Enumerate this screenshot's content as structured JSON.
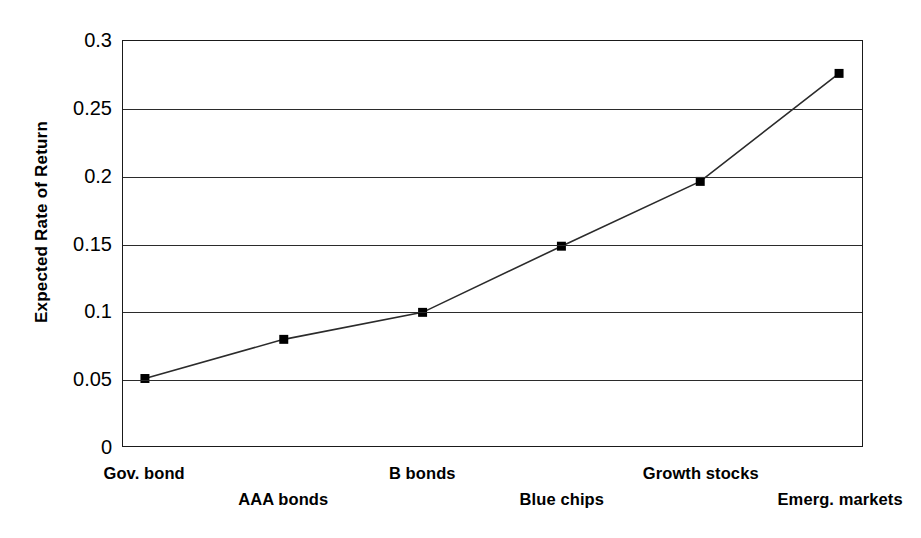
{
  "chart_data": {
    "type": "line",
    "title": "",
    "xlabel": "",
    "ylabel": "Expected Rate of Return",
    "categories": [
      "Gov. bond",
      "AAA bonds",
      "B bonds",
      "Blue chips",
      "Growth stocks",
      "Emerg. markets"
    ],
    "values": [
      0.05,
      0.079,
      0.099,
      0.148,
      0.196,
      0.276
    ],
    "series": [
      {
        "name": "Expected Rate of Return",
        "values": [
          0.05,
          0.079,
          0.099,
          0.148,
          0.196,
          0.276
        ]
      }
    ],
    "ylim": [
      0,
      0.3
    ],
    "ytick_labels": [
      "0.3",
      "0.25",
      "0.2",
      "0.15",
      "0.1",
      "0.05",
      "0"
    ],
    "ytick_values": [
      0.3,
      0.25,
      0.2,
      0.15,
      0.1,
      0.05,
      0
    ],
    "grid": true,
    "grid_axis": "y",
    "legend": false,
    "legend_position": "none",
    "marker": "square",
    "marker_color": "#000000",
    "line_color": "#2b2b2b",
    "plot_background": "#ffffff",
    "xtick_marks": false,
    "xlabel_stagger": true,
    "annotations": []
  },
  "axes": {
    "y_title": "Expected Rate of Return"
  }
}
